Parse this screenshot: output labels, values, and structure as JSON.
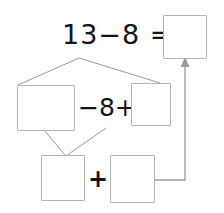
{
  "worksheet": {
    "title": "Make-ten subtraction decomposition",
    "width": 224,
    "height": 213,
    "background_color": "#ffffff",
    "box_border_color": "#b4b4b4",
    "connector_color": "#9a9a9a",
    "text_color": "#141414"
  },
  "rows": {
    "top": {
      "expression": "13−8 =",
      "minuend": "13",
      "operator": "−",
      "subtrahend": "8",
      "equals": "=",
      "answer_box_value": "",
      "answer_box_placeholder": ""
    },
    "middle": {
      "left_box_value": "",
      "expression": "−8+",
      "operator_minus": "−",
      "number": "8",
      "operator_plus": "+",
      "right_box_value": ""
    },
    "bottom": {
      "left_box_value": "",
      "operator_plus": "+",
      "right_box_value": ""
    }
  },
  "connectors": [
    {
      "name": "split-13-into-parts",
      "type": "branch-down",
      "from": "top-expression",
      "to": [
        "middle-left-box",
        "middle-right-box"
      ]
    },
    {
      "name": "combine-into-bottom-left",
      "type": "branch-up",
      "from": [
        "middle-left-box",
        "middle-area"
      ],
      "to": "bottom-left-box"
    },
    {
      "name": "result-arrow",
      "type": "elbow-arrow",
      "from": "bottom-right-box",
      "to": "top-answer-box",
      "arrowhead": "up"
    }
  ]
}
